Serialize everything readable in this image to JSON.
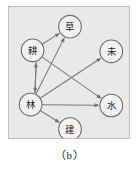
{
  "figure": {
    "caption": "（b）",
    "panel": {
      "background_color": "#e9e9e9",
      "border_color": "#bdbdbd"
    }
  },
  "diagram": {
    "type": "directed-graph",
    "title": "",
    "node_fill_color": "#f2f2f2",
    "node_stroke_color": "#6b6b6b",
    "edge_color": "#7a7a7a",
    "nodes": [
      {
        "id": "cao",
        "label": "草",
        "name": "node-cao",
        "cx": 62,
        "cy": 20,
        "r": 11.5
      },
      {
        "id": "geng",
        "label": "耕",
        "name": "node-geng",
        "cx": 24,
        "cy": 44,
        "r": 11.5
      },
      {
        "id": "wei",
        "label": "未",
        "name": "node-wei",
        "cx": 104,
        "cy": 45,
        "r": 11.5
      },
      {
        "id": "lin",
        "label": "林",
        "name": "node-lin",
        "cx": 22,
        "cy": 99,
        "r": 11.5
      },
      {
        "id": "shui",
        "label": "水",
        "name": "node-shui",
        "cx": 104,
        "cy": 100,
        "r": 11.5
      },
      {
        "id": "jian",
        "label": "建",
        "name": "node-jian",
        "cx": 62,
        "cy": 124,
        "r": 11.5
      }
    ],
    "edges": [
      {
        "from": "geng",
        "to": "cao",
        "name": "edge-geng-to-cao",
        "directed": true
      },
      {
        "from": "lin",
        "to": "cao",
        "name": "edge-lin-to-cao",
        "directed": true
      },
      {
        "from": "geng",
        "to": "lin",
        "name": "edge-geng-to-lin",
        "directed": true,
        "offset": -4
      },
      {
        "from": "lin",
        "to": "geng",
        "name": "edge-lin-to-geng",
        "directed": true,
        "offset": 4
      },
      {
        "from": "geng",
        "to": "shui",
        "name": "edge-geng-to-shui",
        "directed": true
      },
      {
        "from": "lin",
        "to": "shui",
        "name": "edge-lin-to-shui",
        "directed": true
      },
      {
        "from": "lin",
        "to": "wei",
        "name": "edge-lin-to-wei",
        "directed": true
      },
      {
        "from": "lin",
        "to": "jian",
        "name": "edge-lin-to-jian",
        "directed": true
      }
    ]
  }
}
